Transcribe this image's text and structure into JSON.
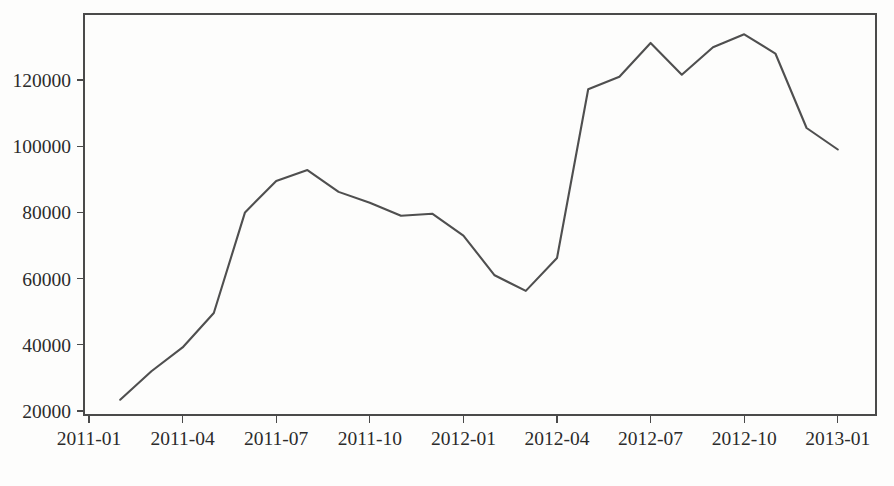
{
  "chart_data": {
    "type": "line",
    "title": "",
    "subtitle": "",
    "xlabel": "",
    "ylabel": "",
    "grid": false,
    "legend": false,
    "legend_position": "none",
    "line_color": "#4f4f4f",
    "background_color": "#fdfdfc",
    "axis_color": "#4a4a4a",
    "xlim": [
      "2011-01",
      "2013-01"
    ],
    "ylim": [
      20000,
      137000
    ],
    "y_ticks": [
      20000,
      40000,
      60000,
      80000,
      100000,
      120000
    ],
    "y_tick_labels": [
      "20000",
      "40000",
      "60000",
      "80000",
      "100000",
      "120000"
    ],
    "x_ticks": [
      "2011-01",
      "2011-04",
      "2011-07",
      "2011-10",
      "2012-01",
      "2012-04",
      "2012-07",
      "2012-10",
      "2013-01"
    ],
    "x_tick_labels": [
      "2011-01",
      "2011-04",
      "2011-07",
      "2011-10",
      "2012-01",
      "2012-04",
      "2012-07",
      "2012-10",
      "2013-01"
    ],
    "x": [
      "2011-02",
      "2011-03",
      "2011-04",
      "2011-05",
      "2011-06",
      "2011-07",
      "2011-08",
      "2011-09",
      "2011-10",
      "2011-11",
      "2011-12",
      "2012-01",
      "2012-02",
      "2012-03",
      "2012-04",
      "2012-05",
      "2012-06",
      "2012-07",
      "2012-08",
      "2012-09",
      "2012-10",
      "2012-11",
      "2012-12",
      "2013-01"
    ],
    "values": [
      23400,
      32000,
      39200,
      49600,
      80000,
      89500,
      92800,
      86200,
      82900,
      79000,
      79600,
      73000,
      61000,
      56300,
      66200,
      117200,
      121000,
      131200,
      121600,
      129900,
      133800,
      128000,
      105500,
      99000
    ],
    "series": [
      {
        "name": "value",
        "color": "#4f4f4f",
        "values": [
          23400,
          32000,
          39200,
          49600,
          80000,
          89500,
          92800,
          86200,
          82900,
          79000,
          79600,
          73000,
          61000,
          56300,
          66200,
          117200,
          121000,
          131200,
          121600,
          129900,
          133800,
          128000,
          105500,
          99000
        ]
      }
    ]
  },
  "plot": {
    "frame_left": 84,
    "frame_right": 876,
    "frame_top": 14,
    "frame_bottom": 415,
    "y_value_at_bottom_tick": 20000,
    "y_pixel_at_bottom_tick": 411,
    "y_value_at_top_tick": 120000,
    "y_pixel_at_top_tick": 80,
    "x_pixel_at_first_tick": 89,
    "x_pixels_per_month": 31.2
  }
}
